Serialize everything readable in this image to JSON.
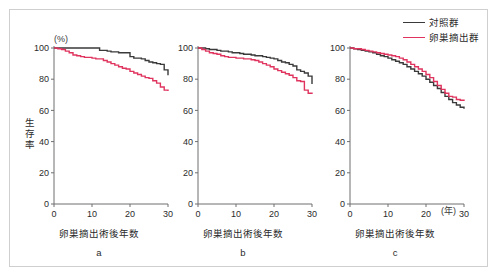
{
  "figure": {
    "legend": {
      "position": "top-right",
      "entries": [
        {
          "label": "対照群",
          "color": "#3a3a3a",
          "name": "control-group"
        },
        {
          "label": "卵巣摘出群",
          "color": "#e0345f",
          "name": "ovariectomy-group"
        }
      ]
    },
    "y_axis_title": "生存率",
    "y_unit_label": "(%)",
    "colors": {
      "control": "#3a3a3a",
      "ovariectomy": "#e0345f",
      "axis": "#6e6e6e",
      "frame": "#cfcfcf",
      "text": "#2b2b2b"
    }
  },
  "chart_data": [
    {
      "type": "line",
      "panel": "a",
      "panel_label": "a",
      "title": "",
      "xlabel": "卵巣摘出術後年数",
      "ylabel": "生存率",
      "y_unit": "(%)",
      "xlim": [
        0,
        30
      ],
      "ylim": [
        0,
        100
      ],
      "xticks": [
        0,
        10,
        20,
        30
      ],
      "yticks": [
        0,
        20,
        40,
        60,
        80,
        100
      ],
      "xtick_labels": [
        "0",
        "10",
        "20",
        "30"
      ],
      "ytick_labels": [
        "0",
        "20",
        "40",
        "60",
        "80",
        "100"
      ],
      "grid": false,
      "step": true,
      "series": [
        {
          "name": "対照群",
          "color": "#3a3a3a",
          "x": [
            0,
            2,
            4,
            6,
            8,
            10,
            11,
            12,
            13,
            14,
            15,
            16,
            17,
            18,
            19,
            20,
            21,
            22,
            23,
            24,
            25,
            26,
            27,
            28,
            29,
            30
          ],
          "values": [
            100,
            100,
            100,
            100,
            100,
            100,
            100,
            98.5,
            98.5,
            98,
            97.5,
            97.5,
            97,
            97,
            97,
            94.5,
            93.5,
            93.5,
            93,
            92,
            91,
            90.5,
            90,
            89.5,
            86,
            82.5
          ]
        },
        {
          "name": "卵巣摘出群",
          "color": "#e0345f",
          "x": [
            0,
            1,
            2,
            3,
            4,
            5,
            6,
            7,
            8,
            9,
            10,
            11,
            12,
            13,
            14,
            15,
            16,
            17,
            18,
            19,
            20,
            21,
            22,
            23,
            24,
            25,
            26,
            27,
            28,
            29,
            30
          ],
          "values": [
            100,
            99.5,
            99,
            98,
            97,
            95.5,
            95,
            94.5,
            94,
            94,
            93.5,
            93,
            93,
            92,
            91,
            90,
            89,
            88,
            87,
            86.5,
            85,
            84,
            83,
            82,
            81,
            80.5,
            79,
            77.5,
            75,
            73,
            72.5
          ]
        }
      ]
    },
    {
      "type": "line",
      "panel": "b",
      "panel_label": "b",
      "title": "",
      "xlabel": "卵巣摘出術後年数",
      "ylabel": "",
      "xlim": [
        0,
        30
      ],
      "ylim": [
        0,
        100
      ],
      "xticks": [
        0,
        10,
        20,
        30
      ],
      "yticks": [
        0,
        20,
        40,
        60,
        80,
        100
      ],
      "xtick_labels": [
        "0",
        "10",
        "20",
        "30"
      ],
      "ytick_labels": [
        "0",
        "20",
        "40",
        "60",
        "80",
        "100"
      ],
      "grid": false,
      "step": true,
      "series": [
        {
          "name": "対照群",
          "color": "#3a3a3a",
          "x": [
            0,
            1,
            2,
            3,
            4,
            5,
            6,
            7,
            8,
            9,
            10,
            11,
            12,
            13,
            14,
            15,
            16,
            17,
            18,
            19,
            20,
            21,
            22,
            23,
            24,
            25,
            26,
            27,
            28,
            29,
            30
          ],
          "values": [
            100,
            100,
            99.5,
            99,
            99,
            98.5,
            98,
            98,
            97.5,
            97,
            97,
            96.5,
            96,
            96,
            95.5,
            95,
            95,
            94.5,
            94,
            93.5,
            93,
            92,
            91,
            90.5,
            89.5,
            88.5,
            86,
            85,
            84,
            82,
            77
          ]
        },
        {
          "name": "卵巣摘出群",
          "color": "#e0345f",
          "x": [
            0,
            1,
            2,
            3,
            4,
            5,
            6,
            7,
            8,
            9,
            10,
            11,
            12,
            13,
            14,
            15,
            16,
            17,
            18,
            19,
            20,
            21,
            22,
            23,
            24,
            25,
            26,
            27,
            28,
            29,
            30
          ],
          "values": [
            100,
            99,
            98,
            97,
            96.5,
            96,
            95,
            94.5,
            94,
            94,
            93.5,
            93.5,
            93,
            93,
            92.5,
            92,
            91,
            90,
            89,
            88,
            86.5,
            85.5,
            84.5,
            83.5,
            82.5,
            81,
            79,
            78.5,
            73,
            71,
            70.5
          ]
        }
      ]
    },
    {
      "type": "line",
      "panel": "c",
      "panel_label": "c",
      "title": "",
      "xlabel": "卵巣摘出術後年数",
      "ylabel": "",
      "x_unit": "(年)",
      "xlim": [
        0,
        30
      ],
      "ylim": [
        0,
        100
      ],
      "xticks": [
        0,
        10,
        20,
        30
      ],
      "yticks": [
        0,
        20,
        40,
        60,
        80,
        100
      ],
      "xtick_labels": [
        "0",
        "10",
        "20",
        "30"
      ],
      "ytick_labels": [
        "0",
        "20",
        "40",
        "60",
        "80",
        "100"
      ],
      "grid": false,
      "step": true,
      "series": [
        {
          "name": "対照群",
          "color": "#3a3a3a",
          "x": [
            0,
            1,
            2,
            3,
            4,
            5,
            6,
            7,
            8,
            9,
            10,
            11,
            12,
            13,
            14,
            15,
            16,
            17,
            18,
            19,
            20,
            21,
            22,
            23,
            24,
            25,
            26,
            27,
            28,
            29,
            30
          ],
          "values": [
            100,
            99.5,
            99,
            98.5,
            98,
            97.5,
            97,
            96,
            95,
            94.5,
            93.5,
            92.5,
            91.5,
            90.5,
            89.5,
            88,
            86.5,
            85,
            83.5,
            82,
            80,
            78,
            76,
            74,
            71.5,
            69,
            67,
            65,
            63.5,
            62,
            61
          ]
        },
        {
          "name": "卵巣摘出群",
          "color": "#e0345f",
          "x": [
            0,
            1,
            2,
            3,
            4,
            5,
            6,
            7,
            8,
            9,
            10,
            11,
            12,
            13,
            14,
            15,
            16,
            17,
            18,
            19,
            20,
            21,
            22,
            23,
            24,
            25,
            26,
            27,
            28,
            29,
            30
          ],
          "values": [
            100,
            99.5,
            99.5,
            99,
            98.5,
            98,
            97.5,
            97,
            96.5,
            96,
            95.5,
            95,
            94.5,
            93.5,
            92.5,
            91,
            89.5,
            88,
            86.5,
            85,
            83,
            81,
            78.5,
            76,
            73.5,
            71,
            69,
            68.5,
            67,
            66.5,
            66
          ]
        }
      ]
    }
  ]
}
